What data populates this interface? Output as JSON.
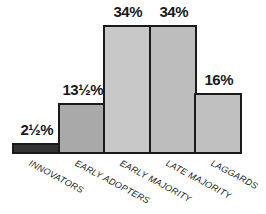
{
  "chart_data": {
    "type": "bar",
    "title": "",
    "xlabel": "",
    "ylabel": "",
    "categories": [
      "INNOVATORS",
      "EARLY ADOPTERS",
      "EARLY MAJORITY",
      "LATE MAJORITY",
      "LAGGARDS"
    ],
    "values": [
      2.5,
      13.5,
      34,
      34,
      16
    ],
    "value_labels": [
      "2½%",
      "13½%",
      "34%",
      "34%",
      "16%"
    ],
    "ylim": [
      0,
      34
    ],
    "grid": false,
    "legend": null,
    "colors": [
      "#333333",
      "#a9a9a9",
      "#c8c8c8",
      "#bdbdbd",
      "#c0c0c0"
    ]
  }
}
